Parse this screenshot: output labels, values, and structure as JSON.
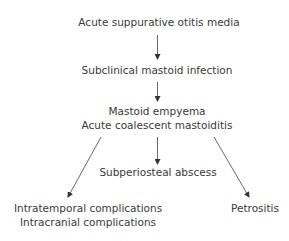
{
  "diagram": {
    "type": "flowchart",
    "nodes": [
      {
        "id": "aom",
        "label": "Acute suppurative otitis media"
      },
      {
        "id": "subclinical",
        "label": "Subclinical mastoid infection"
      },
      {
        "id": "empyema",
        "lines": [
          "Mastoid empyema",
          "Acute coalescent mastoiditis"
        ]
      },
      {
        "id": "subperiosteal",
        "label": "Subperiosteal abscess"
      },
      {
        "id": "complications",
        "lines": [
          "Intratemporal complications",
          "Intracranial complications"
        ]
      },
      {
        "id": "petrositis",
        "label": "Petrositis"
      }
    ],
    "edges": [
      {
        "from": "aom",
        "to": "subclinical"
      },
      {
        "from": "subclinical",
        "to": "empyema"
      },
      {
        "from": "empyema",
        "to": "complications"
      },
      {
        "from": "empyema",
        "to": "subperiosteal"
      },
      {
        "from": "empyema",
        "to": "petrositis"
      }
    ]
  }
}
